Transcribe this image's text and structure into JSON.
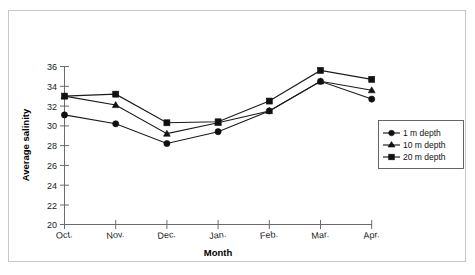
{
  "chart_data": {
    "type": "line",
    "title": "",
    "xlabel": "Month",
    "ylabel": "Average salinity",
    "categories": [
      "Oct.",
      "Nov.",
      "Dec.",
      "Jan.",
      "Feb.",
      "Mar.",
      "Apr."
    ],
    "ylim": [
      20,
      36
    ],
    "yticks": [
      20,
      22,
      24,
      26,
      28,
      30,
      32,
      34,
      36
    ],
    "ytick_labels": [
      "20",
      "22",
      "24",
      "26",
      "28",
      "30",
      "32",
      "34",
      "36"
    ],
    "grid": false,
    "legend_position": "right-middle",
    "series": [
      {
        "name": "1 m depth",
        "marker": "circle",
        "values": [
          31.1,
          30.2,
          28.2,
          29.4,
          31.5,
          34.5,
          32.7
        ]
      },
      {
        "name": "10 m depth",
        "marker": "triangle",
        "values": [
          33.0,
          32.1,
          29.2,
          30.3,
          31.5,
          34.5,
          33.6
        ]
      },
      {
        "name": "20 m depth",
        "marker": "square",
        "values": [
          33.0,
          33.2,
          30.3,
          30.4,
          32.5,
          35.6,
          34.7
        ]
      }
    ],
    "colors": {
      "series_line": "#1a1a1a",
      "marker": "#111111",
      "axis": "#6b6b6b",
      "frame": "#c8c8c8",
      "background": "#ffffff"
    }
  },
  "axes": {
    "y_title": "Average salinity",
    "x_title": "Month"
  },
  "legend": {
    "entries": [
      {
        "label": "1 m depth",
        "marker": "circle-marker-icon"
      },
      {
        "label": "10 m depth",
        "marker": "triangle-marker-icon"
      },
      {
        "label": "20 m depth",
        "marker": "square-marker-icon"
      }
    ]
  },
  "y_tick_labels": {
    "t0": "20",
    "t1": "22",
    "t2": "24",
    "t3": "26",
    "t4": "28",
    "t5": "30",
    "t6": "32",
    "t7": "34",
    "t8": "36"
  },
  "x_tick_labels": {
    "t0": "Oct.",
    "t1": "Nov.",
    "t2": "Dec.",
    "t3": "Jan.",
    "t4": "Feb.",
    "t5": "Mar.",
    "t6": "Apr."
  }
}
